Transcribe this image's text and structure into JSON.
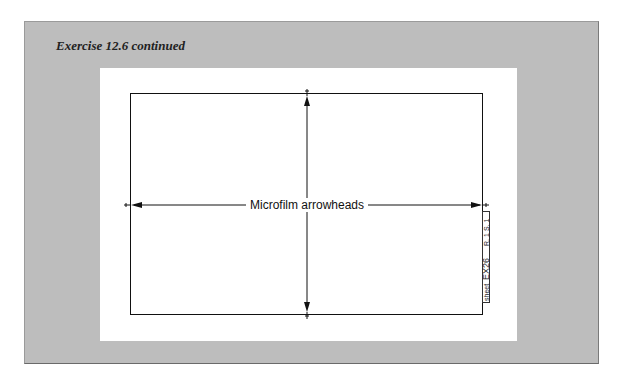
{
  "caption": "Exercise 12.6 continued",
  "drawing": {
    "label": "Microfilm arrowheads",
    "title_block": {
      "cells": [
        "sheet",
        "EX26",
        "R. 1",
        "S. 1"
      ]
    }
  },
  "colors": {
    "frame_background": "#bdbdbd",
    "panel_background": "#ffffff",
    "line": "#111111"
  }
}
